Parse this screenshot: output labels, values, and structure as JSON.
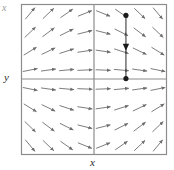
{
  "figure": {
    "kind": "slope-field",
    "background": "#ffffff",
    "frame_color": "#8c8c8c",
    "axis_color": "#8c8c8c",
    "arrow_color": "#6e6e6e",
    "trajectory_color": "#3a3a3a",
    "marker_color": "#1a1a1a",
    "corner_mark": "x"
  },
  "axes": {
    "xlabel": "x",
    "ylabel": "y",
    "xlim": [
      -4,
      4
    ],
    "ylim": [
      -4,
      4
    ],
    "grid": false,
    "frame": {
      "left": 21,
      "top": 4,
      "right": 167,
      "bottom": 155
    },
    "origin": {
      "x": 94,
      "y": 79
    }
  },
  "chart_data": {
    "type": "scatter",
    "title": "",
    "xlabel": "x",
    "ylabel": "y",
    "xlim": [
      -4,
      4
    ],
    "ylim": [
      -4,
      4
    ],
    "grid": false,
    "legend": "none",
    "field": {
      "x": [
        -3.5,
        -2.5,
        -1.5,
        -0.5,
        0.5,
        1.5,
        2.5,
        3.5
      ],
      "y": [
        3.5,
        2.5,
        1.5,
        0.5,
        -0.5,
        -1.5,
        -2.5,
        -3.5
      ],
      "slope_rule": "dy/dx = -x*y",
      "slopes": [
        [
          1.2,
          0.95,
          0.7,
          0.4,
          -0.4,
          -0.7,
          -0.95,
          -1.2
        ],
        [
          0.95,
          0.75,
          0.5,
          0.25,
          -0.25,
          -0.5,
          -0.75,
          -0.95
        ],
        [
          0.62,
          0.48,
          0.32,
          0.15,
          -0.15,
          -0.32,
          -0.48,
          -0.62
        ],
        [
          0.2,
          0.14,
          0.09,
          0.04,
          -0.04,
          -0.09,
          -0.14,
          -0.2
        ],
        [
          -0.2,
          -0.14,
          -0.09,
          -0.04,
          0.04,
          0.09,
          0.14,
          0.2
        ],
        [
          -0.62,
          -0.48,
          -0.32,
          -0.15,
          0.15,
          0.32,
          0.48,
          0.62
        ],
        [
          -0.95,
          -0.75,
          -0.5,
          -0.25,
          0.25,
          0.5,
          0.75,
          0.95
        ],
        [
          -1.2,
          -0.95,
          -0.7,
          -0.4,
          0.4,
          0.7,
          0.95,
          1.2
        ]
      ]
    },
    "trajectory": {
      "name": "solution-curve",
      "direction": "downward",
      "x_constant": 1.75,
      "y_start": 3.4,
      "y_end": 0.05,
      "arrow_at_y": 1.7,
      "endpoints": [
        {
          "label": "start-point",
          "x": 1.75,
          "y": 3.4
        },
        {
          "label": "end-point",
          "x": 1.75,
          "y": 0.05
        }
      ]
    }
  }
}
